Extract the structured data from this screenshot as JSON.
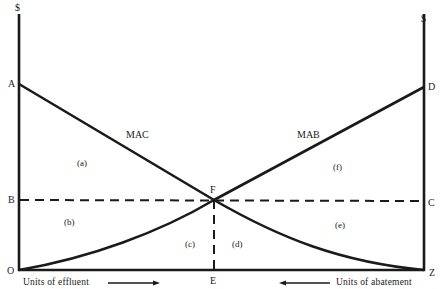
{
  "diagram": {
    "type": "economics-marginal-abatement",
    "left_axis_unit": "$",
    "right_axis_unit": "$",
    "points": {
      "A": "A",
      "B": "B",
      "C": "C",
      "D": "D",
      "E": "E",
      "F": "F",
      "O": "O",
      "Z": "Z"
    },
    "curves": {
      "mac": "MAC",
      "mab": "MAB"
    },
    "areas": {
      "a": "(a)",
      "b": "(b)",
      "c": "(c)",
      "d": "(d)",
      "e": "(e)",
      "f": "(f)"
    },
    "x_axis": {
      "left_label": "Units of effluent",
      "right_label": "Units of abatement"
    },
    "colors": {
      "ink": "#1a1a1a",
      "background": "#ffffff"
    }
  }
}
